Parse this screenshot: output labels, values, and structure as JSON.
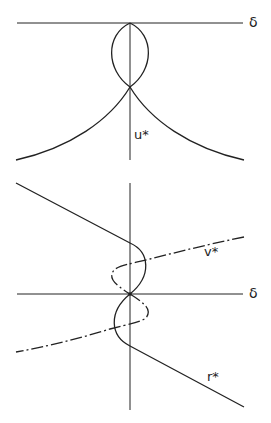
{
  "top_diagram": {
    "axis_label": "δ",
    "curve_label": "u*"
  },
  "bottom_diagram": {
    "axis_label": "δ",
    "curve_labels": {
      "dashdot": "v*",
      "solid": "r*"
    }
  },
  "colors": {
    "stroke": "#222222",
    "background": "#ffffff"
  }
}
